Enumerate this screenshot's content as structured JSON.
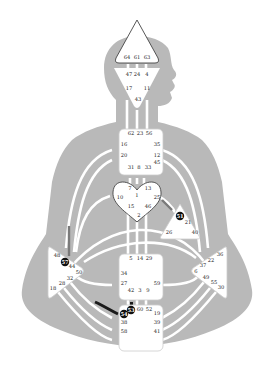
{
  "colors": {
    "background": "#ffffff",
    "body_silhouette": "#b9b9b9",
    "channel_white": "#ffffff",
    "center_fill": "#ffffff",
    "center_stroke": "#444444",
    "active_gate": "#111111",
    "channel_dark": "#1a1a1a",
    "channel_grey": "#7a7a7a"
  },
  "centers": {
    "head": {
      "name": "Head",
      "gates": [
        "64",
        "61",
        "63"
      ]
    },
    "ajna": {
      "name": "Ajna",
      "gates": [
        "47",
        "24",
        "4",
        "17",
        "11",
        "43"
      ]
    },
    "throat": {
      "name": "Throat",
      "gates": [
        "62",
        "23",
        "56",
        "16",
        "35",
        "20",
        "12",
        "45",
        "31",
        "8",
        "33"
      ]
    },
    "g": {
      "name": "G",
      "gates": [
        "7",
        "1",
        "13",
        "10",
        "25",
        "15",
        "46",
        "2"
      ]
    },
    "ego": {
      "name": "Heart/Ego",
      "gates": [
        "51",
        "21",
        "26",
        "40"
      ]
    },
    "spleen": {
      "name": "Spleen",
      "gates": [
        "48",
        "57",
        "44",
        "50",
        "32",
        "28",
        "18"
      ]
    },
    "sacral": {
      "name": "Sacral",
      "gates": [
        "5",
        "14",
        "29",
        "34",
        "27",
        "59",
        "42",
        "3",
        "9"
      ]
    },
    "solar_plexus": {
      "name": "Solar Plexus",
      "gates": [
        "36",
        "22",
        "37",
        "6",
        "49",
        "55",
        "30"
      ]
    },
    "root": {
      "name": "Root",
      "gates": [
        "53",
        "60",
        "52",
        "54",
        "19",
        "38",
        "39",
        "58",
        "41"
      ]
    }
  },
  "active_gates": [
    "51",
    "57",
    "53",
    "54"
  ]
}
